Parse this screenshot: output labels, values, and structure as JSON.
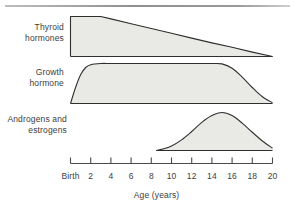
{
  "figure": {
    "name": "hormone-secretion-vs-age",
    "axis_title": "Age (years)"
  },
  "axis": {
    "tick_labels": [
      "Birth",
      "2",
      "4",
      "6",
      "8",
      "10",
      "12",
      "14",
      "16",
      "18",
      "20"
    ],
    "tick_values": [
      0,
      2,
      4,
      6,
      8,
      10,
      12,
      14,
      16,
      18,
      20
    ],
    "xlim": [
      0,
      20
    ]
  },
  "series_labels": {
    "thyroid": "Thyroid\nhormones",
    "thyroid_line1": "Thyroid",
    "thyroid_line2": "hormones",
    "growth_line1": "Growth",
    "growth_line2": "hormone",
    "androgen_line1": "Androgens and",
    "androgen_line2": "estrogens"
  },
  "colors": {
    "curve_fill": "#e9e9e6",
    "curve_stroke": "#2f2f2f",
    "axis": "#4a4a4a",
    "text": "#3d3d3d",
    "top_rule": "#9a9a9a",
    "background": "#ffffff"
  },
  "chart_data": {
    "type": "area",
    "title": "",
    "subtitle": "",
    "xlabel": "Age (years)",
    "ylabel": "",
    "xlim": [
      0,
      20
    ],
    "ylim": [
      0,
      1
    ],
    "grid": false,
    "legend": "inline-left-labels",
    "xtick_labels": [
      "Birth",
      "2",
      "4",
      "6",
      "8",
      "10",
      "12",
      "14",
      "16",
      "18",
      "20"
    ],
    "xticks": [
      0,
      2,
      4,
      6,
      8,
      10,
      12,
      14,
      16,
      18,
      20
    ],
    "series": [
      {
        "name": "Thyroid hormones",
        "label_lines": [
          "Thyroid",
          "hormones"
        ],
        "x": [
          0,
          1,
          2,
          3,
          4,
          6,
          8,
          10,
          12,
          14,
          16,
          18,
          20
        ],
        "values": [
          1.0,
          1.0,
          1.0,
          1.0,
          0.94,
          0.82,
          0.7,
          0.58,
          0.46,
          0.34,
          0.23,
          0.11,
          0.0
        ],
        "shape": "flat then linear decline",
        "plateau_until_age": 3,
        "ends_at_age": 20
      },
      {
        "name": "Growth hormone",
        "label_lines": [
          "Growth",
          "hormone"
        ],
        "x": [
          0,
          0.5,
          1,
          1.5,
          2,
          3,
          4,
          6,
          8,
          10,
          12,
          14,
          15,
          16,
          17,
          18,
          19,
          20
        ],
        "values": [
          0.0,
          0.4,
          0.72,
          0.9,
          0.97,
          1.0,
          1.0,
          1.0,
          1.0,
          1.0,
          1.0,
          1.0,
          0.99,
          0.88,
          0.66,
          0.4,
          0.17,
          0.02
        ],
        "shape": "rapid rise, long plateau, decline after puberty",
        "plateau_from_age": 3,
        "plateau_until_age": 15,
        "ends_at_age": 20
      },
      {
        "name": "Androgens and estrogens",
        "label_lines": [
          "Androgens and",
          "estrogens"
        ],
        "x": [
          8.5,
          9,
          10,
          11,
          12,
          13,
          14,
          15,
          16,
          17,
          18,
          19,
          20
        ],
        "values": [
          0.0,
          0.03,
          0.12,
          0.28,
          0.5,
          0.74,
          0.92,
          1.0,
          0.92,
          0.72,
          0.48,
          0.25,
          0.06
        ],
        "shape": "bell curve",
        "starts_at_age": 8.5,
        "peak_age": 15,
        "ends_at_age": 20
      }
    ]
  }
}
